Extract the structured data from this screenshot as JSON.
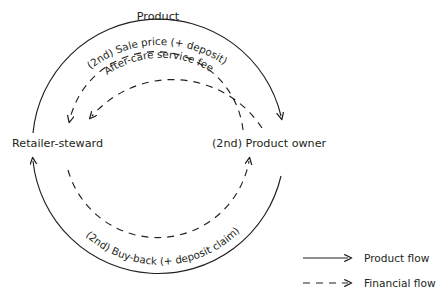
{
  "diagram": {
    "title_label": "Product",
    "nodes": [
      {
        "id": "retailer",
        "label": "Retailer-steward"
      },
      {
        "id": "owner",
        "label": "(2nd) Product owner"
      }
    ],
    "flows": [
      {
        "id": "product-flow-out",
        "label": "Product",
        "type": "product",
        "style": "solid",
        "from": "Retailer-steward",
        "to": "(2nd) Product owner",
        "direction": "clockwise-top"
      },
      {
        "id": "sale-price",
        "label": "(2nd) Sale price (+ deposit)",
        "type": "financial",
        "style": "dashed",
        "from": "(2nd) Product owner",
        "to": "Retailer-steward",
        "direction": "counter-clockwise-top"
      },
      {
        "id": "after-care-fee",
        "label": "After-care service fee",
        "type": "financial",
        "style": "dashed",
        "from": "(2nd) Product owner",
        "to": "Retailer-steward",
        "direction": "counter-clockwise-top"
      },
      {
        "id": "buy-back",
        "label": "(2nd) Buy-back (+ deposit claim)",
        "type": "financial",
        "style": "dashed",
        "from": "Retailer-steward",
        "to": "(2nd) Product owner",
        "direction": "clockwise-bottom"
      },
      {
        "id": "product-flow-return",
        "label": "",
        "type": "product",
        "style": "solid",
        "from": "(2nd) Product owner",
        "to": "Retailer-steward",
        "direction": "counter-clockwise-bottom"
      }
    ],
    "legend": {
      "items": [
        {
          "id": "product-flow",
          "label": "Product flow",
          "style": "solid"
        },
        {
          "id": "financial-flow",
          "label": "Financial flow",
          "style": "dashed"
        }
      ]
    },
    "colors": {
      "ink": "#231f20",
      "background": "#ffffff"
    }
  }
}
